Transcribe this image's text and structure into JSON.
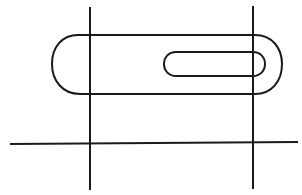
{
  "diagram": {
    "type": "technical-drawing",
    "background": "#ffffff",
    "stroke_color": "#1a1a1a",
    "stroke_width": 2,
    "reference_lines": [
      {
        "id": "vertical-left",
        "x1": 90,
        "y1": 7,
        "x2": 90,
        "y2": 190
      },
      {
        "id": "vertical-right",
        "x1": 253,
        "y1": 6,
        "x2": 253,
        "y2": 189
      },
      {
        "id": "horizontal",
        "x1": 10,
        "y1": 144,
        "x2": 298,
        "y2": 142
      }
    ],
    "outer_slot": {
      "top": 35,
      "bottom": 94,
      "left": 52,
      "right": 282,
      "left_straight_start": 78,
      "right_straight_end": 255
    },
    "inner_slot": {
      "top": 52,
      "bottom": 76,
      "left": 164,
      "right": 265,
      "radius": 12
    }
  }
}
